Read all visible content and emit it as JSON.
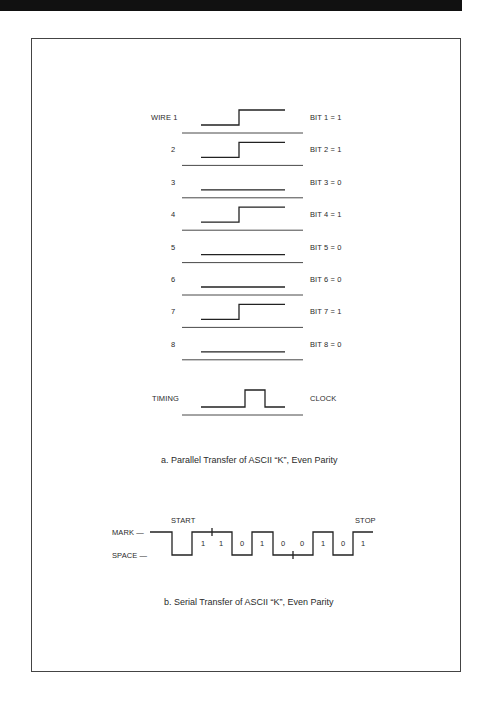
{
  "header": {
    "bar_color": "#111111"
  },
  "parallel": {
    "wire_label_prefix": "WIRE",
    "rows": [
      {
        "wire": "WIRE 1",
        "bit_label": "BIT 1 = 1",
        "value": 1
      },
      {
        "wire": "2",
        "bit_label": "BIT 2 = 1",
        "value": 1
      },
      {
        "wire": "3",
        "bit_label": "BIT 3 = 0",
        "value": 0
      },
      {
        "wire": "4",
        "bit_label": "BIT 4 = 1",
        "value": 1
      },
      {
        "wire": "5",
        "bit_label": "BIT 5 = 0",
        "value": 0
      },
      {
        "wire": "6",
        "bit_label": "BIT 6 = 0",
        "value": 0
      },
      {
        "wire": "7",
        "bit_label": "BIT 7 = 1",
        "value": 1
      },
      {
        "wire": "8",
        "bit_label": "BIT 8 = 0",
        "value": 0
      }
    ],
    "timing": {
      "label": "TIMING",
      "right_label": "CLOCK"
    },
    "caption": "a. Parallel Transfer of ASCII “K”, Even Parity"
  },
  "serial": {
    "mark_label": "MARK —",
    "space_label": "SPACE —",
    "start_label": "START",
    "stop_label": "STOP",
    "bits": [
      "1",
      "1",
      "0",
      "1",
      "0",
      "0",
      "1",
      "0",
      "1"
    ],
    "caption": "b. Serial Transfer of ASCII “K”, Even Parity"
  }
}
